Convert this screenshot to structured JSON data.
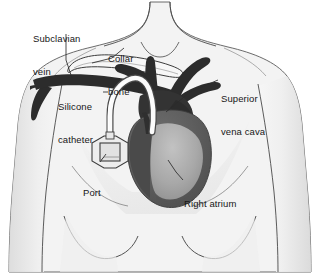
{
  "figure": {
    "width": 320,
    "height": 274,
    "background_color": "#ffffff"
  },
  "colors": {
    "skin_fill": "#f2f2f2",
    "skin_shadow": "#e0e0e0",
    "outline": "#3a3a3a",
    "vein_dark": "#2e2e2e",
    "heart_dark": "#5e5e5e",
    "heart_mid": "#8c8c8c",
    "heart_light": "#b4b4b4",
    "catheter_white": "#fbfbfb",
    "catheter_outline": "#4a4a4a",
    "port_fill": "#ededed",
    "port_outline": "#3d3d3d",
    "label_text": "#171717",
    "leader_line": "#2b2b2b"
  },
  "labels": [
    {
      "id": "subclavian-vein",
      "name": "label-subclavian-vein",
      "lines": [
        "Subclavian",
        "vein"
      ],
      "x": 33,
      "y": 11
    },
    {
      "id": "collar-bone",
      "name": "label-collar-bone",
      "lines": [
        "Collar",
        "bone"
      ],
      "x": 108,
      "y": 31
    },
    {
      "id": "silicone-catheter",
      "name": "label-silicone-catheter",
      "lines": [
        "Silicone",
        "catheter"
      ],
      "x": 58,
      "y": 79
    },
    {
      "id": "superior-vena-cava",
      "name": "label-superior-vena-cava",
      "lines": [
        "Superior",
        "vena cava"
      ],
      "x": 221,
      "y": 71
    },
    {
      "id": "right-atrium",
      "name": "label-right-atrium",
      "lines": [
        "Right atrium"
      ],
      "x": 184,
      "y": 176
    },
    {
      "id": "port",
      "name": "label-port",
      "lines": [
        "Port"
      ],
      "x": 83,
      "y": 165
    }
  ],
  "anatomy": {
    "body": "Upper torso, neck, shoulders and arms in light grey outline",
    "clavicle": "Collar bone drawn as elongated outlined bone over the left chest",
    "subclavian_vein": "Dark vein running beneath the collar bone toward the shoulder",
    "great_vessels": "Dark branching vessels above the heart including aortic arch branches",
    "heart": "Shaded heart with darker right atrium and lighter ventricle",
    "catheter": "White silicone tube from the port curving up and into the vein",
    "port": "Small rectangular implanted port with square septum under the skin"
  }
}
